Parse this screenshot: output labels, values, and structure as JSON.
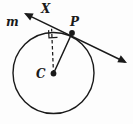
{
  "figure": {
    "type": "geometry-diagram",
    "background_color": "#fdfdfd",
    "stroke_color": "#1a1a1a",
    "labels": {
      "line_m": "m",
      "point_x": "X",
      "point_p": "P",
      "center_c": "C"
    },
    "elements": {
      "circle": {
        "name": "circle-c",
        "center_x": 53.5,
        "center_y": 73,
        "radius": 40.5,
        "stroke_width": 1.4
      },
      "tangent_line": {
        "name": "line-m",
        "x1": 24,
        "y1": 13,
        "x2": 127,
        "y2": 63,
        "stroke_width": 1.5,
        "arrow_start": true,
        "arrow_end": true
      },
      "radius_segment": {
        "name": "segment-cp",
        "x1": 53.5,
        "y1": 73.5,
        "x2": 72,
        "y2": 33,
        "stroke_width": 1.5,
        "style": "solid"
      },
      "perpendicular_segment": {
        "name": "segment-cx",
        "x1": 53.5,
        "y1": 73.5,
        "x2": 51.5,
        "y2": 28.5,
        "stroke_width": 1.3,
        "style": "dashed",
        "dash_pattern": "3.5,2.5"
      },
      "right_angle_marker": {
        "name": "right-angle-marker",
        "vertex_x": 51.5,
        "vertex_y": 28.5,
        "size": 8.5
      },
      "point_p_dot": {
        "name": "point-p",
        "cx": 72,
        "cy": 33,
        "r": 2.9
      },
      "point_c_dot": {
        "name": "point-c",
        "cx": 53.5,
        "cy": 73.5,
        "r": 2.9
      }
    }
  }
}
